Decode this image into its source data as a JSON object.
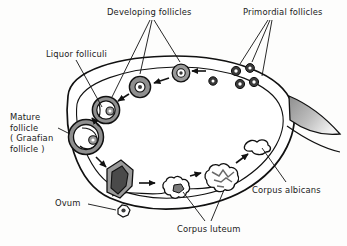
{
  "figure": {
    "background_color": "#fdfdfc",
    "outline_color": "#111111",
    "fill_color": "#ffffff",
    "structure_gray": "#8a8a8a",
    "structure_dark": "#3a3a3a"
  },
  "labels": {
    "developing_follicles": "Developing follicles",
    "primordial_follicles": "Primordial follicles",
    "liquor_folliculi": "Liquor folliculi",
    "mature_follicle": "Mature\nfollicle\n( Graafian\nfollicle )",
    "corpus_albicans": "Corpus albicans",
    "corpus_luteum": "Corpus luteum",
    "ovum": "Ovum"
  },
  "structures": {
    "primordial_follicles_count": 5,
    "developing_follicles_count": 3,
    "corpus_luteum_count": 2,
    "mature_follicle_count": 1,
    "ruptured_follicle_count": 1,
    "corpus_albicans_count": 1,
    "ovum_count": 1
  },
  "cycle_sequence": [
    "primordial follicle",
    "developing follicle",
    "developing follicle",
    "liquor folliculi",
    "mature (Graafian) follicle",
    "ruptured follicle / ovulation",
    "ovum",
    "corpus luteum",
    "corpus luteum",
    "corpus albicans"
  ]
}
